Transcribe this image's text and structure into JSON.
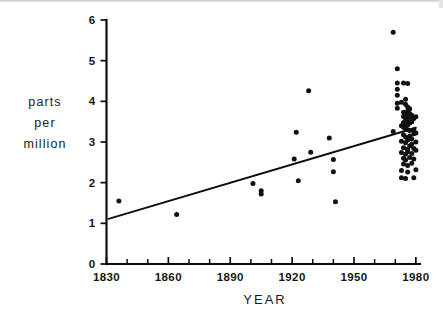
{
  "figure": {
    "name": "atmospheric-concentration-scatter",
    "background": "#ffffff",
    "ink_color": "#111111"
  },
  "axis_titles": {
    "x": "YEAR",
    "y_line1": "parts",
    "y_line2": "per",
    "y_line3": "million"
  },
  "chart_data": {
    "type": "scatter",
    "title": "",
    "xlabel": "YEAR",
    "ylabel": "parts per million",
    "xlim": [
      1830,
      1982
    ],
    "ylim": [
      0,
      6
    ],
    "grid": false,
    "legend": "none",
    "x_ticks_major": [
      1830,
      1860,
      1890,
      1920,
      1950,
      1980
    ],
    "x_tick_labels": [
      "1830",
      "1860",
      "1890",
      "1920",
      "1950",
      "1980"
    ],
    "x_tick_minor_step": 10,
    "y_ticks": [
      0,
      1,
      2,
      3,
      4,
      5,
      6
    ],
    "y_tick_labels": [
      "0",
      "1",
      "2",
      "3",
      "4",
      "5",
      "6"
    ],
    "marker": "filled-circle",
    "series": [
      {
        "name": "measurements",
        "points": [
          [
            1836,
            1.55
          ],
          [
            1864,
            1.22
          ],
          [
            1901,
            1.98
          ],
          [
            1905,
            1.8
          ],
          [
            1905,
            1.72
          ],
          [
            1921,
            2.58
          ],
          [
            1922,
            3.24
          ],
          [
            1923,
            2.05
          ],
          [
            1928,
            4.26
          ],
          [
            1929,
            2.75
          ],
          [
            1938,
            3.1
          ],
          [
            1940,
            2.57
          ],
          [
            1940,
            2.27
          ],
          [
            1941,
            1.53
          ],
          [
            1969,
            5.7
          ],
          [
            1971,
            4.8
          ],
          [
            1971,
            4.45
          ],
          [
            1971,
            4.3
          ],
          [
            1971,
            4.15
          ],
          [
            1974,
            4.45
          ],
          [
            1976,
            4.44
          ],
          [
            1971,
            3.95
          ],
          [
            1971,
            3.83
          ],
          [
            1973,
            3.98
          ],
          [
            1975,
            4.05
          ],
          [
            1975,
            3.93
          ],
          [
            1976,
            3.86
          ],
          [
            1976,
            3.76
          ],
          [
            1977,
            3.82
          ],
          [
            1977,
            3.7
          ],
          [
            1974,
            3.73
          ],
          [
            1974,
            3.63
          ],
          [
            1975,
            3.68
          ],
          [
            1975,
            3.58
          ],
          [
            1976,
            3.62
          ],
          [
            1976,
            3.52
          ],
          [
            1977,
            3.6
          ],
          [
            1978,
            3.66
          ],
          [
            1979,
            3.58
          ],
          [
            1980,
            3.62
          ],
          [
            1974,
            3.48
          ],
          [
            1975,
            3.45
          ],
          [
            1976,
            3.42
          ],
          [
            1977,
            3.47
          ],
          [
            1978,
            3.5
          ],
          [
            1973,
            3.4
          ],
          [
            1974,
            3.36
          ],
          [
            1975,
            3.33
          ],
          [
            1976,
            3.3
          ],
          [
            1969,
            3.26
          ],
          [
            1977,
            3.28
          ],
          [
            1979,
            3.3
          ],
          [
            1980,
            3.22
          ],
          [
            1974,
            3.18
          ],
          [
            1975,
            3.12
          ],
          [
            1977,
            3.15
          ],
          [
            1978,
            3.08
          ],
          [
            1979,
            3.2
          ],
          [
            1973,
            3.02
          ],
          [
            1975,
            2.98
          ],
          [
            1976,
            3.05
          ],
          [
            1978,
            2.95
          ],
          [
            1980,
            3.0
          ],
          [
            1974,
            2.86
          ],
          [
            1976,
            2.82
          ],
          [
            1977,
            2.9
          ],
          [
            1979,
            2.84
          ],
          [
            1973,
            2.74
          ],
          [
            1975,
            2.7
          ],
          [
            1976,
            2.76
          ],
          [
            1978,
            2.72
          ],
          [
            1980,
            2.8
          ],
          [
            1974,
            2.6
          ],
          [
            1975,
            2.56
          ],
          [
            1977,
            2.62
          ],
          [
            1979,
            2.58
          ],
          [
            1974,
            2.46
          ],
          [
            1976,
            2.42
          ],
          [
            1978,
            2.48
          ],
          [
            1973,
            2.3
          ],
          [
            1976,
            2.26
          ],
          [
            1980,
            2.32
          ],
          [
            1973,
            2.12
          ],
          [
            1975,
            2.1
          ],
          [
            1979,
            2.12
          ]
        ]
      }
    ],
    "trendline": {
      "name": "linear-fit",
      "x_start": 1831,
      "y_start": 1.11,
      "x_end": 1980,
      "y_end": 3.35
    }
  }
}
